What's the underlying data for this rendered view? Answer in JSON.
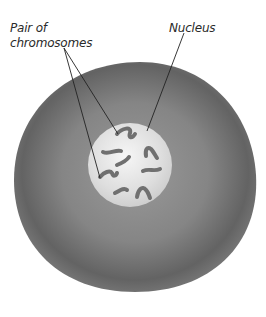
{
  "diagram": {
    "type": "cell-illustration",
    "labels": {
      "pair_line1": "Pair of",
      "pair_line2": "chromosomes",
      "nucleus": "Nucleus"
    },
    "colors": {
      "cytoplasm_outer": "#6a6a6a",
      "cytoplasm_inner": "#8c8c8c",
      "nucleus_fill": "#e2e2e2",
      "chromosome": "#6e6e6e",
      "leader_line": "#222222"
    },
    "chromosome_count": 10
  }
}
